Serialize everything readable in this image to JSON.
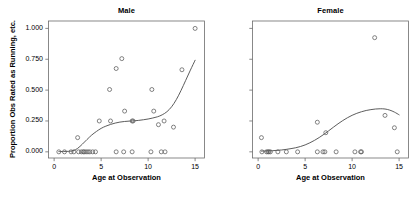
{
  "chart_data": {
    "type": "scatter",
    "title": "",
    "xlabel": "Age at Observation",
    "ylabel": "Proportion Obs Rated as Running, etc.",
    "xlim": [
      -0.6,
      16.0
    ],
    "ylim": [
      -0.05,
      1.06
    ],
    "grid": false,
    "legend": "none",
    "xticks": [
      0,
      5,
      10,
      15
    ],
    "xtick_labels": [
      "0",
      "5",
      "10",
      "15"
    ],
    "yticks": [
      0.0,
      0.25,
      0.5,
      0.75,
      1.0
    ],
    "ytick_labels": [
      "0.000",
      "0.250",
      "0.500",
      "0.750",
      "1.000"
    ],
    "panels": [
      {
        "label": "Male",
        "points": [
          [
            0.5,
            0.0
          ],
          [
            1.1,
            0.0
          ],
          [
            1.8,
            0.0
          ],
          [
            2.1,
            0.0
          ],
          [
            2.5,
            0.115
          ],
          [
            2.6,
            0.0
          ],
          [
            2.9,
            0.0
          ],
          [
            3.1,
            0.0
          ],
          [
            3.2,
            0.0
          ],
          [
            3.4,
            0.0
          ],
          [
            3.6,
            0.0
          ],
          [
            3.8,
            0.0
          ],
          [
            4.1,
            0.0
          ],
          [
            4.4,
            0.0
          ],
          [
            4.8,
            0.25
          ],
          [
            6.0,
            0.25
          ],
          [
            5.9,
            0.505
          ],
          [
            6.6,
            0.675
          ],
          [
            6.6,
            0.0
          ],
          [
            7.2,
            0.755
          ],
          [
            7.4,
            0.0
          ],
          [
            7.5,
            0.33
          ],
          [
            8.3,
            0.25
          ],
          [
            8.4,
            0.25
          ],
          [
            8.3,
            0.0
          ],
          [
            10.3,
            0.0
          ],
          [
            10.4,
            0.505
          ],
          [
            10.6,
            0.33
          ],
          [
            11.1,
            0.22
          ],
          [
            11.4,
            0.0
          ],
          [
            11.7,
            0.25
          ],
          [
            11.8,
            0.0
          ],
          [
            12.7,
            0.2
          ],
          [
            13.6,
            0.665
          ],
          [
            15.0,
            1.0
          ]
        ],
        "smooth": [
          [
            0.5,
            0.002
          ],
          [
            1.0,
            0.003
          ],
          [
            1.5,
            0.004
          ],
          [
            2.0,
            0.008
          ],
          [
            2.5,
            0.028
          ],
          [
            3.0,
            0.062
          ],
          [
            3.5,
            0.1
          ],
          [
            4.0,
            0.136
          ],
          [
            4.5,
            0.165
          ],
          [
            5.0,
            0.19
          ],
          [
            5.5,
            0.208
          ],
          [
            6.0,
            0.222
          ],
          [
            6.5,
            0.233
          ],
          [
            7.0,
            0.241
          ],
          [
            7.5,
            0.246
          ],
          [
            8.0,
            0.249
          ],
          [
            8.5,
            0.251
          ],
          [
            9.0,
            0.255
          ],
          [
            9.5,
            0.26
          ],
          [
            10.0,
            0.266
          ],
          [
            10.5,
            0.274
          ],
          [
            11.0,
            0.284
          ],
          [
            11.5,
            0.3
          ],
          [
            12.0,
            0.325
          ],
          [
            12.5,
            0.365
          ],
          [
            13.0,
            0.423
          ],
          [
            13.5,
            0.497
          ],
          [
            14.0,
            0.579
          ],
          [
            14.5,
            0.662
          ],
          [
            15.0,
            0.742
          ]
        ]
      },
      {
        "label": "Female",
        "points": [
          [
            0.35,
            0.115
          ],
          [
            0.4,
            0.0
          ],
          [
            0.9,
            0.0
          ],
          [
            1.05,
            0.0
          ],
          [
            1.15,
            0.0
          ],
          [
            1.3,
            0.0
          ],
          [
            2.1,
            0.0
          ],
          [
            3.0,
            0.0
          ],
          [
            4.2,
            0.0
          ],
          [
            6.3,
            0.24
          ],
          [
            6.3,
            0.0
          ],
          [
            6.9,
            0.0
          ],
          [
            7.1,
            0.0
          ],
          [
            7.2,
            0.155
          ],
          [
            8.3,
            0.0
          ],
          [
            10.3,
            0.0
          ],
          [
            10.9,
            0.0
          ],
          [
            11.0,
            0.0
          ],
          [
            12.4,
            0.925
          ],
          [
            13.5,
            0.295
          ],
          [
            14.5,
            0.195
          ],
          [
            14.8,
            0.0
          ]
        ],
        "smooth": [
          [
            0.35,
            0.006
          ],
          [
            1.0,
            0.007
          ],
          [
            1.5,
            0.009
          ],
          [
            2.0,
            0.012
          ],
          [
            2.5,
            0.015
          ],
          [
            3.0,
            0.02
          ],
          [
            3.5,
            0.026
          ],
          [
            4.0,
            0.033
          ],
          [
            4.5,
            0.043
          ],
          [
            5.0,
            0.056
          ],
          [
            5.5,
            0.073
          ],
          [
            6.0,
            0.093
          ],
          [
            6.5,
            0.116
          ],
          [
            7.0,
            0.142
          ],
          [
            7.5,
            0.17
          ],
          [
            8.0,
            0.199
          ],
          [
            8.5,
            0.227
          ],
          [
            9.0,
            0.253
          ],
          [
            9.5,
            0.276
          ],
          [
            10.0,
            0.296
          ],
          [
            10.5,
            0.312
          ],
          [
            11.0,
            0.325
          ],
          [
            11.5,
            0.335
          ],
          [
            12.0,
            0.342
          ],
          [
            12.5,
            0.347
          ],
          [
            13.0,
            0.349
          ],
          [
            13.5,
            0.347
          ],
          [
            14.0,
            0.338
          ],
          [
            14.5,
            0.322
          ],
          [
            15.0,
            0.3
          ]
        ]
      }
    ]
  }
}
